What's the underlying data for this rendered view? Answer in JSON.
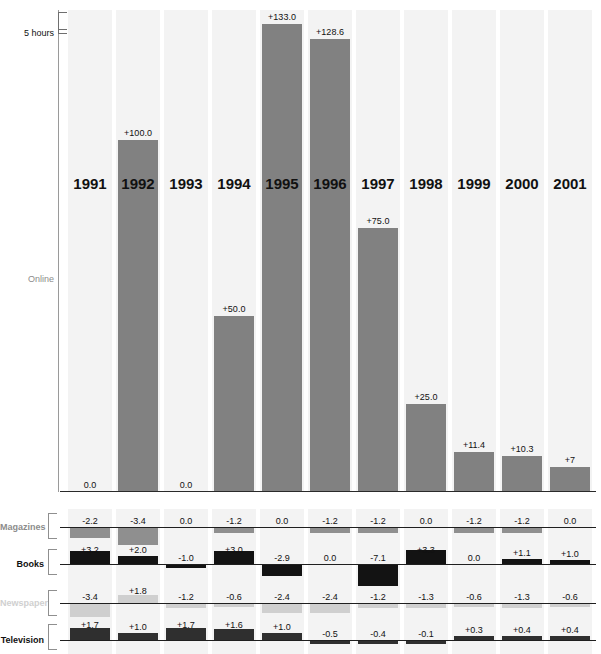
{
  "axis": {
    "top_label": "5 hours",
    "series_label": "Online"
  },
  "years": [
    "1991",
    "1992",
    "1993",
    "1994",
    "1995",
    "1996",
    "1997",
    "1998",
    "1999",
    "2000",
    "2001"
  ],
  "rows": [
    {
      "name": "Magazines",
      "label": "Magazines",
      "color": "#8f8f8f",
      "label_color": "#8c8c8c"
    },
    {
      "name": "Books",
      "label": "Books",
      "color": "#131313",
      "label_color": "#111111"
    },
    {
      "name": "Newspaper",
      "label": "Newspaper",
      "color": "#cfcfcf",
      "label_color": "#d0d0d0"
    },
    {
      "name": "Television",
      "label": "Television",
      "color": "#2f2f2f",
      "label_color": "#111111"
    }
  ],
  "chart_data": {
    "type": "bar",
    "title": "",
    "subtitle": "",
    "xlabel": "",
    "ylabel": "5 hours",
    "grid": false,
    "legend_position": "left",
    "categories": [
      "1991",
      "1992",
      "1993",
      "1994",
      "1995",
      "1996",
      "1997",
      "1998",
      "1999",
      "2000",
      "2001"
    ],
    "series": [
      {
        "name": "Online",
        "unit": "percent change",
        "values": [
          0.0,
          100.0,
          0.0,
          50.0,
          133.0,
          128.6,
          75.0,
          25.0,
          11.4,
          10.3,
          7.0
        ],
        "labels": [
          "0.0",
          "+100.0",
          "0.0",
          "+50.0",
          "+133.0",
          "+128.6",
          "+75.0",
          "+25.0",
          "+11.4",
          "+10.3",
          "+7"
        ]
      },
      {
        "name": "Magazines",
        "unit": "percent change",
        "values": [
          -2.2,
          -3.4,
          0.0,
          -1.2,
          0.0,
          -1.2,
          -1.2,
          0.0,
          -1.2,
          -1.2,
          0.0
        ],
        "labels": [
          "-2.2",
          "-3.4",
          "0.0",
          "-1.2",
          "0.0",
          "-1.2",
          "-1.2",
          "0.0",
          "-1.2",
          "-1.2",
          "0.0"
        ]
      },
      {
        "name": "Books",
        "unit": "percent change",
        "values": [
          3.2,
          2.0,
          -1.0,
          3.0,
          -2.9,
          0.0,
          -7.1,
          3.3,
          0.0,
          1.1,
          1.0
        ],
        "labels": [
          "+3.2",
          "+2.0",
          "-1.0",
          "+3.0",
          "-2.9",
          "0.0",
          "-7.1",
          "+3.3",
          "0.0",
          "+1.1",
          "+1.0"
        ]
      },
      {
        "name": "Newspaper",
        "unit": "percent change",
        "values": [
          -3.4,
          1.8,
          -1.2,
          -0.6,
          -2.4,
          -2.4,
          -1.2,
          -1.3,
          -0.6,
          -1.3,
          -0.6
        ],
        "labels": [
          "-3.4",
          "+1.8",
          "-1.2",
          "-0.6",
          "-2.4",
          "-2.4",
          "-1.2",
          "-1.3",
          "-0.6",
          "-1.3",
          "-0.6"
        ]
      },
      {
        "name": "Television",
        "unit": "percent change",
        "values": [
          1.7,
          1.0,
          1.7,
          1.6,
          1.0,
          -0.5,
          -0.4,
          -0.1,
          0.3,
          0.4,
          0.4
        ],
        "labels": [
          "+1.7",
          "+1.0",
          "+1.7",
          "+1.6",
          "+1.0",
          "-0.5",
          "-0.4",
          "-0.1",
          "+0.3",
          "+0.4",
          "+0.4"
        ]
      }
    ]
  }
}
